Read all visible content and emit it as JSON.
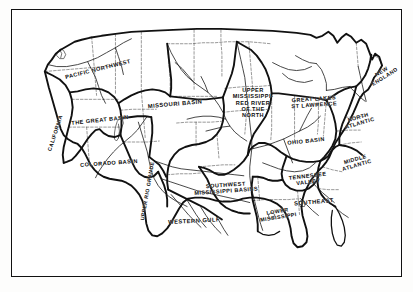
{
  "figure": {
    "kind": "map",
    "title": "",
    "frame_color": "#111111",
    "background_color": "#ffffff",
    "ink_color": "#0d0d0d",
    "boundary_style": "hand-drawn ink line map of United States water resource regions"
  },
  "map": {
    "country_outline": "United States (contiguous 48 states)",
    "features": [
      "state boundaries (dashed thin lines)",
      "water resource region boundaries (heavy solid lines)",
      "major rivers (thin solid lines)",
      "coastline and Great Lakes shoreline"
    ],
    "regions": [
      {
        "name": "PACIFIC NORTHWEST",
        "label_lines": [
          "PACIFIC NORTHWEST"
        ],
        "x": 86,
        "y": 59,
        "rotate": -14,
        "font_size": 5.6
      },
      {
        "name": "CALIFORNIA",
        "label_lines": [
          "CALIFORNIA"
        ],
        "x": 43,
        "y": 123,
        "rotate": -72,
        "font_size": 5.4
      },
      {
        "name": "THE GREAT BASIN",
        "label_lines": [
          "THE GREAT BASIN"
        ],
        "x": 88,
        "y": 110,
        "rotate": -6,
        "font_size": 5.6
      },
      {
        "name": "COLORADO BASIN",
        "label_lines": [
          "COLORADO BASIN"
        ],
        "x": 97,
        "y": 153,
        "rotate": -4,
        "font_size": 5.6
      },
      {
        "name": "UPPER RIO GRANDE",
        "label_lines": [
          "UPPER RIO GRANDE"
        ],
        "x": 136,
        "y": 181,
        "rotate": -80,
        "font_size": 5.2
      },
      {
        "name": "MISSOURI BASIN",
        "label_lines": [
          "MISSOURI BASIN"
        ],
        "x": 163,
        "y": 94,
        "rotate": -5,
        "font_size": 5.8
      },
      {
        "name": "UPPER MISSISSIPPI - RED RIVER OF THE NORTH",
        "label_lines": [
          "UPPER",
          "MISSISSIPPI-",
          "RED RIVER",
          "OF THE",
          "NORTH"
        ],
        "x": 241,
        "y": 93,
        "rotate": 0,
        "font_size": 5.6
      },
      {
        "name": "GREAT LAKES ST LAWRENCE",
        "label_lines": [
          "GREAT LAKES",
          "ST LAWRENCE"
        ],
        "x": 302,
        "y": 92,
        "rotate": -4,
        "font_size": 5.6
      },
      {
        "name": "NEW ENGLAND",
        "label_lines": [
          "NEW",
          "ENGLAND"
        ],
        "x": 371,
        "y": 64,
        "rotate": -32,
        "font_size": 5.4
      },
      {
        "name": "NORTH ATLANTIC",
        "label_lines": [
          "NORTH",
          "ATLANTIC"
        ],
        "x": 347,
        "y": 110,
        "rotate": -16,
        "font_size": 5.4
      },
      {
        "name": "MIDDLE ATLANTIC",
        "label_lines": [
          "MIDDLE",
          "ATLANTIC"
        ],
        "x": 344,
        "y": 152,
        "rotate": -16,
        "font_size": 5.4
      },
      {
        "name": "OHIO BASIN",
        "label_lines": [
          "OHIO BASIN"
        ],
        "x": 294,
        "y": 131,
        "rotate": -6,
        "font_size": 5.6
      },
      {
        "name": "TENNESSEE VALLEY",
        "label_lines": [
          "TENNESSEE",
          "VALLEY"
        ],
        "x": 296,
        "y": 169,
        "rotate": -7,
        "font_size": 5.6
      },
      {
        "name": "SOUTHEAST",
        "label_lines": [
          "SOUTHEAST"
        ],
        "x": 302,
        "y": 192,
        "rotate": -5,
        "font_size": 5.8
      },
      {
        "name": "LOWER MISSISSIPPI",
        "label_lines": [
          "LOWER",
          "MISSISSIPPI"
        ],
        "x": 266,
        "y": 204,
        "rotate": -9,
        "font_size": 5.4
      },
      {
        "name": "SOUTHWEST MISSISSIPPI BASINS",
        "label_lines": [
          "SOUTHWEST",
          "MISSISSIPPI BASINS"
        ],
        "x": 214,
        "y": 178,
        "rotate": -4,
        "font_size": 5.6
      },
      {
        "name": "WESTERN GULF",
        "label_lines": [
          "WESTERN GULF"
        ],
        "x": 182,
        "y": 211,
        "rotate": -3,
        "font_size": 5.8
      }
    ]
  }
}
